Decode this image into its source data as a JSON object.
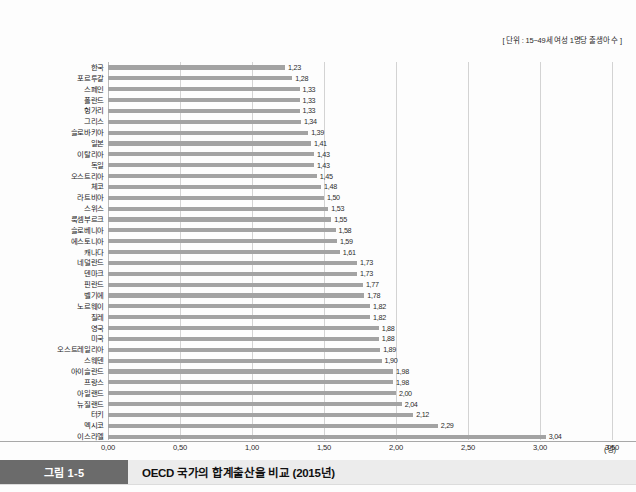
{
  "figure": {
    "unit_note": "[ 단위 : 15~49세 여성 1명당 출생아 수 ]",
    "caption_badge": "그림 1-5",
    "caption_title": "OECD 국가의 합계출산율 비교 (2015년)",
    "x_unit": "(명)"
  },
  "chart_data": {
    "type": "bar",
    "orientation": "horizontal",
    "title": "OECD 국가의 합계출산율 비교 (2015년)",
    "subtitle": "[ 단위 : 15~49세 여성 1명당 출생아 수 ]",
    "xlabel": "(명)",
    "ylabel": "",
    "xlim": [
      0.0,
      3.5
    ],
    "xticks": [
      "0,00",
      "0,50",
      "1,00",
      "1,50",
      "2,00",
      "2,50",
      "3,00",
      "3,50"
    ],
    "xtick_values": [
      0.0,
      0.5,
      1.0,
      1.5,
      2.0,
      2.5,
      3.0,
      3.5
    ],
    "grid": true,
    "legend": false,
    "bar_color": "#a3a3a3",
    "decimal_separator": ",",
    "categories": [
      "한국",
      "포르투갈",
      "스페인",
      "폴란드",
      "헝가리",
      "그리스",
      "슬로바키아",
      "일본",
      "이탈리아",
      "독일",
      "오스트리아",
      "체코",
      "라트비아",
      "스위스",
      "룩셈부르크",
      "슬로베니아",
      "에스토니아",
      "캐나다",
      "네덜란드",
      "덴마크",
      "핀란드",
      "벨기에",
      "노르웨이",
      "칠레",
      "영국",
      "미국",
      "오스트레일리아",
      "스웨덴",
      "아이슬란드",
      "프랑스",
      "아일랜드",
      "뉴질랜드",
      "터키",
      "멕시코",
      "이스라엘"
    ],
    "values": [
      1.23,
      1.28,
      1.33,
      1.33,
      1.33,
      1.34,
      1.39,
      1.41,
      1.43,
      1.43,
      1.45,
      1.48,
      1.5,
      1.53,
      1.55,
      1.58,
      1.59,
      1.61,
      1.73,
      1.73,
      1.77,
      1.78,
      1.82,
      1.82,
      1.88,
      1.88,
      1.89,
      1.9,
      1.98,
      1.98,
      2.0,
      2.04,
      2.12,
      2.29,
      3.04
    ],
    "value_labels": [
      "1,23",
      "1,28",
      "1,33",
      "1,33",
      "1,33",
      "1,34",
      "1,39",
      "1,41",
      "1,43",
      "1,43",
      "1,45",
      "1,48",
      "1,50",
      "1,53",
      "1,55",
      "1,58",
      "1,59",
      "1,61",
      "1,73",
      "1,73",
      "1,77",
      "1,78",
      "1,82",
      "1,82",
      "1,88",
      "1,88",
      "1,89",
      "1,90",
      "1,98",
      "1,98",
      "2,00",
      "2,04",
      "2,12",
      "2,29",
      "3,04"
    ]
  }
}
